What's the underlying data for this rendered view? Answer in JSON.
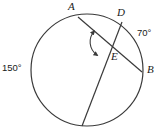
{
  "figure": {
    "type": "circle-geometry-diagram",
    "stroke_color": "#3a3a3a",
    "background_color": "#ffffff",
    "text_color": "#1a1a1a"
  },
  "circle": {
    "center_x": 87,
    "center_y": 70,
    "radius": 56
  },
  "points": {
    "A": {
      "label": "A",
      "x": 78,
      "y": 17
    },
    "D": {
      "label": "D",
      "x": 122,
      "y": 22
    },
    "B": {
      "label": "B",
      "x": 142,
      "y": 72
    },
    "E": {
      "label": "E",
      "x": 108,
      "y": 48
    },
    "C": {
      "label": "",
      "x": 82,
      "y": 126
    }
  },
  "chords": [
    {
      "name": "chord-A-B",
      "from": "A",
      "to": "B"
    },
    {
      "name": "chord-D-C",
      "from": "D",
      "to": "C"
    }
  ],
  "angle_marker": {
    "name": "angle-E-double-arrow",
    "at_point": "E",
    "style": "double-headed-arc"
  },
  "arc_labels": [
    {
      "name": "arc-label-70",
      "value": "70°",
      "position": "right"
    },
    {
      "name": "arc-label-150",
      "value": "150°",
      "position": "left"
    }
  ],
  "labels": {
    "A": "A",
    "D": "D",
    "E": "E",
    "B": "B",
    "deg70": "70°",
    "deg150": "150°"
  }
}
